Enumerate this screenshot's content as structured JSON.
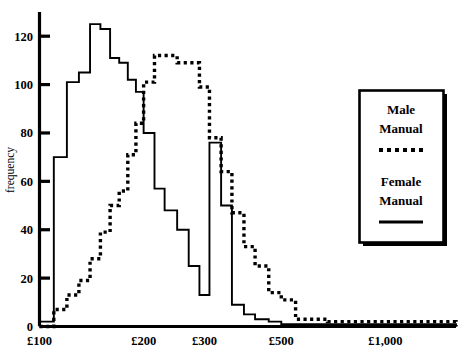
{
  "chart_data": {
    "type": "bar",
    "subtype": "overlaid-histogram",
    "title": "",
    "xlabel": "",
    "ylabel": "frequency",
    "x_scale": "log",
    "xlim": [
      100,
      1600
    ],
    "ylim": [
      0,
      130
    ],
    "yticks": [
      0,
      20,
      40,
      60,
      80,
      100,
      120
    ],
    "ytick_labels": [
      "0",
      "20",
      "40",
      "60",
      "80",
      "100",
      "120"
    ],
    "xticks": [
      100,
      200,
      300,
      500,
      1000
    ],
    "xtick_labels": [
      "£100",
      "£200",
      "£300",
      "£500",
      "£1,000"
    ],
    "grid": false,
    "legend_position": "right",
    "bin_edges": [
      100,
      110,
      120,
      130,
      140,
      150,
      160,
      170,
      180,
      190,
      200,
      215,
      230,
      250,
      270,
      290,
      310,
      335,
      360,
      390,
      420,
      460,
      500,
      550,
      610,
      680,
      760,
      860,
      1000,
      1600
    ],
    "series": [
      {
        "name": "Female Manual",
        "line_style": "solid",
        "values": [
          2,
          70,
          101,
          105,
          125,
          123,
          111,
          109,
          102,
          97,
          80,
          57,
          48,
          40,
          25,
          13,
          76,
          50,
          9,
          5,
          3,
          2,
          1,
          1,
          1,
          1,
          1,
          1,
          1
        ]
      },
      {
        "name": "Male Manual",
        "line_style": "dotted",
        "values": [
          0,
          7,
          13,
          19,
          28,
          39,
          50,
          56,
          71,
          84,
          101,
          112,
          112,
          109,
          109,
          99,
          78,
          64,
          47,
          33,
          25,
          14,
          11,
          3,
          3,
          2,
          2,
          2,
          2
        ]
      }
    ]
  },
  "legend": {
    "entries": [
      {
        "label_line1": "Male",
        "label_line2": "Manual",
        "style": "dotted"
      },
      {
        "label_line1": "Female",
        "label_line2": "Manual",
        "style": "solid"
      }
    ]
  },
  "axes": {
    "y_title": "frequency"
  }
}
